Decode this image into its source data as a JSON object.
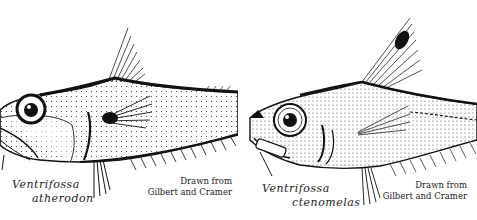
{
  "figures": [
    {
      "species_genus": "Ventrifossa",
      "species_epithet": "atherodon",
      "credit_line1": "Drawn from",
      "credit_line2": "Gilbert and Cramer"
    },
    {
      "species_genus": "Ventrifossa",
      "species_epithet": "ctenomelas",
      "credit_line1": "Drawn from",
      "credit_line2": "Gilbert and Cramer"
    }
  ],
  "colors": {
    "ink": "#1a1a1a",
    "background": "#ffffff"
  }
}
